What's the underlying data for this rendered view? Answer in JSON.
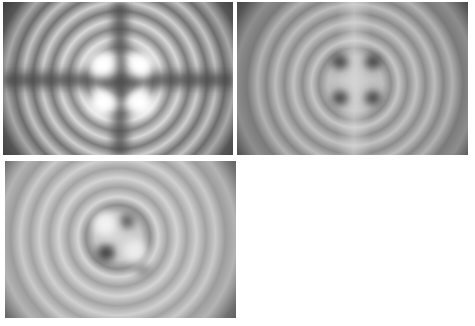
{
  "figure": {
    "panels": [
      {
        "id": "panel-1",
        "position": "top-left",
        "center_feature": "four bright lobes separated by dark cross",
        "lobe_tone": "bright",
        "ring_color_light": "#e8e8e8",
        "ring_color_dark": "#6a6a6a",
        "corner_color": "#2e2e2e"
      },
      {
        "id": "panel-2",
        "position": "top-right",
        "center_feature": "four dark spots on light background",
        "lobe_tone": "dark",
        "ring_color_light": "#c8c8c8",
        "ring_color_dark": "#8a8a8a",
        "corner_color": "#3a3a3a"
      },
      {
        "id": "panel-3",
        "position": "bottom-left",
        "center_feature": "diagonal pair of bright lobes and pair of dark lobes, rotated",
        "lobe_tone": "mixed",
        "ring_color_light": "#d8d8d8",
        "ring_color_dark": "#9a9a9a",
        "corner_color": "#3c3c3c"
      }
    ],
    "background": "#ffffff"
  }
}
